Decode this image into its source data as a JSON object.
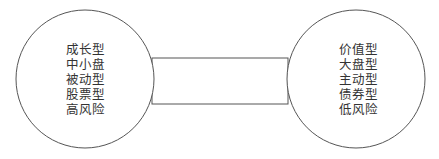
{
  "diagram": {
    "left_circle": {
      "items": [
        "成长型",
        "中小盘",
        "被动型",
        "股票型",
        "高风险"
      ]
    },
    "right_circle": {
      "items": [
        "价值型",
        "大盘型",
        "主动型",
        "债券型",
        "低风险"
      ]
    },
    "stroke_color": "#555555"
  }
}
